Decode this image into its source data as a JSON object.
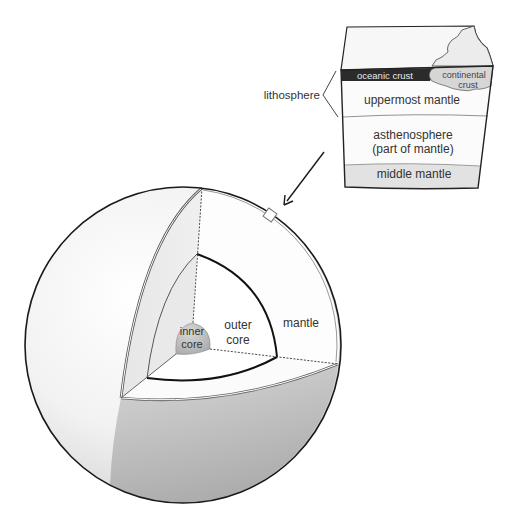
{
  "diagram": {
    "block": {
      "lithosphere_label": "lithosphere",
      "layers": [
        {
          "id": "oceanic-crust",
          "label": "oceanic crust",
          "color": "#2b2b2b",
          "text_color": "#e8e8e8"
        },
        {
          "id": "continental-crust",
          "label_line1": "continental",
          "label_line2": "crust",
          "color": "#d6d6d6"
        },
        {
          "id": "uppermost-mantle",
          "label": "uppermost mantle",
          "color": "#fafafa"
        },
        {
          "id": "asthenosphere",
          "label_line1": "asthenosphere",
          "label_line2": "(part of mantle)",
          "color": "#fafafa"
        },
        {
          "id": "middle-mantle",
          "label": "middle mantle",
          "color": "#e2e2e2"
        }
      ]
    },
    "sphere": {
      "labels": {
        "inner_core_line1": "inner",
        "inner_core_line2": "core",
        "outer_core_line1": "outer",
        "outer_core_line2": "core",
        "mantle": "mantle"
      },
      "colors": {
        "surface": "#f4f4f4",
        "shadow": "#b8b8b8",
        "inner_core": "#bdbdbd",
        "outline": "#1a1a1a"
      }
    }
  }
}
